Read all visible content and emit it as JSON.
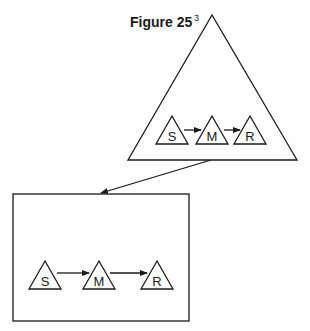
{
  "figure": {
    "title": "Figure 25",
    "superscript": "3"
  },
  "top_triangle": {
    "nodes": [
      {
        "label": "S"
      },
      {
        "label": "M"
      },
      {
        "label": "R"
      }
    ],
    "edges": [
      [
        "S",
        "M"
      ],
      [
        "M",
        "R"
      ]
    ]
  },
  "bottom_box": {
    "nodes": [
      {
        "label": "S"
      },
      {
        "label": "M"
      },
      {
        "label": "R"
      }
    ],
    "edges": [
      [
        "S",
        "M"
      ],
      [
        "M",
        "R"
      ]
    ]
  },
  "connector": {
    "from": "top_triangle",
    "to": "bottom_box"
  }
}
